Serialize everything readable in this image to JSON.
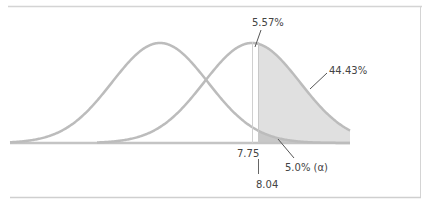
{
  "chart_data": {
    "type": "area",
    "title": "",
    "xlabel": "",
    "ylabel": "",
    "grid": false,
    "series": [
      {
        "name": "null-distribution",
        "mean_px": 160,
        "sigma_px": 48,
        "color": "#b8b8b8"
      },
      {
        "name": "alternative-distribution",
        "mean_px": 252,
        "sigma_px": 48,
        "color": "#b8b8b8"
      }
    ],
    "markers": [
      {
        "label": "7.75",
        "x_px": 252
      },
      {
        "label": "8.04",
        "x_px": 258
      }
    ],
    "annotations": [
      {
        "text": "5.57%",
        "target": "alternative-peak-gap"
      },
      {
        "text": "44.43%",
        "target": "power-region"
      },
      {
        "text": "5.0% (α)",
        "target": "alpha-region"
      }
    ],
    "regions": [
      {
        "name": "power",
        "value_pct": 44.43,
        "from": "8.04",
        "under": "alternative-distribution",
        "color": "#dedede"
      },
      {
        "name": "alpha",
        "value_pct": 5.0,
        "from": "8.04",
        "under": "null-distribution",
        "color": "#c6c6c6"
      },
      {
        "name": "gap",
        "value_pct": 5.57,
        "between": [
          "7.75",
          "8.04"
        ]
      }
    ]
  },
  "labels": {
    "pct_gap": "5.57%",
    "pct_power": "44.43%",
    "pct_alpha": "5.0% (α)",
    "x_775": "7.75",
    "x_804": "8.04"
  },
  "colors": {
    "curve": "#b8b8b8",
    "power_fill": "#e0e0e0",
    "alpha_fill": "#c8c8c8",
    "frame": "#cccccc",
    "text": "#444444"
  }
}
